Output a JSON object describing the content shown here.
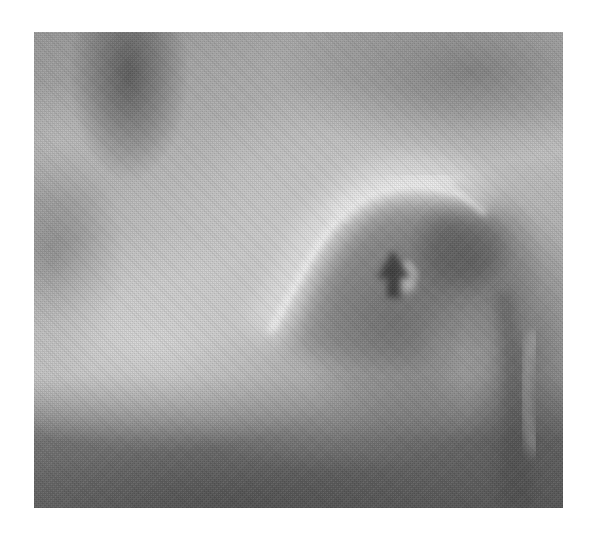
{
  "image": {
    "kind": "grayscale radiograph",
    "subject": "hip joint (acetabular roof over femoral head)",
    "background_color": "#ffffff",
    "frame": {
      "left": 34,
      "top": 32,
      "width": 529,
      "height": 476
    }
  },
  "annotations": [
    {
      "type": "arrow",
      "direction": "up",
      "color": "#3c3c3c",
      "tip": {
        "x": 393,
        "y": 250
      },
      "label": ""
    }
  ],
  "colors": {
    "bright_rim": "#f0f0f0",
    "mid_gray": "#a8a8a8",
    "dark_gray": "#5a5a5a",
    "arrow": "#3c3c3c"
  }
}
